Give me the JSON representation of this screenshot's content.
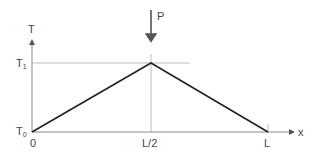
{
  "diagram": {
    "axis_y_label": "T",
    "axis_x_label": "x",
    "load_label": "P",
    "y_ticks": [
      {
        "base": "T",
        "sub": "1"
      },
      {
        "base": "T",
        "sub": "0"
      }
    ],
    "x_ticks": [
      "0",
      "L/2",
      "L"
    ],
    "colors": {
      "curve": "#222222",
      "axis": "#888888",
      "guide": "#aaaaaa",
      "text": "#444444"
    }
  }
}
